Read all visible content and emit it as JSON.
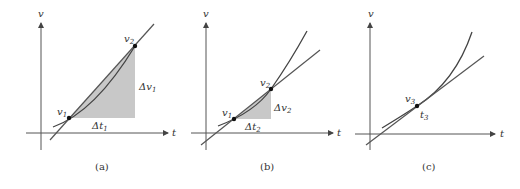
{
  "figure": {
    "fill_color": "#c8c8c8",
    "panels": [
      {
        "id": "a",
        "caption": "(a)",
        "y_axis_label": "v",
        "x_axis_label": "t",
        "line_type": "secant",
        "points": [
          {
            "label": "v",
            "sub": "1"
          },
          {
            "label": "v",
            "sub": "2"
          }
        ],
        "delta_v": {
          "label": "Δv",
          "sub": "1"
        },
        "delta_t": {
          "label": "Δt",
          "sub": "1"
        }
      },
      {
        "id": "b",
        "caption": "(b)",
        "y_axis_label": "v",
        "x_axis_label": "t",
        "line_type": "secant",
        "points": [
          {
            "label": "v",
            "sub": "1"
          },
          {
            "label": "v",
            "sub": "2"
          }
        ],
        "delta_v": {
          "label": "Δv",
          "sub": "2"
        },
        "delta_t": {
          "label": "Δt",
          "sub": "2"
        }
      },
      {
        "id": "c",
        "caption": "(c)",
        "y_axis_label": "v",
        "x_axis_label": "t",
        "line_type": "tangent",
        "points": [
          {
            "label": "v",
            "sub": "3"
          }
        ],
        "time_label": {
          "label": "t",
          "sub": "3"
        }
      }
    ]
  }
}
